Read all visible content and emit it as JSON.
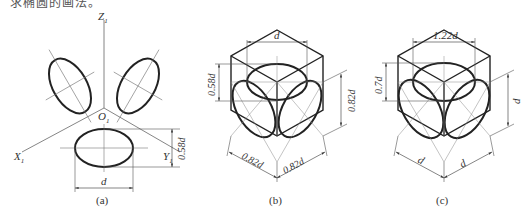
{
  "header_fragment": "求椭圆的画法。",
  "figures": [
    {
      "id": "a",
      "caption": "(a)",
      "axis_labels": {
        "z": "Z",
        "z_sub": "1",
        "x": "X",
        "x_sub": "1",
        "y": "Y",
        "y_sub": "1",
        "origin": "O",
        "origin_sub": "1"
      },
      "dimensions": {
        "width": "d",
        "height": "0.58d"
      }
    },
    {
      "id": "b",
      "caption": "(b)",
      "dimensions": {
        "top": "d",
        "left_vertical": "0.58d",
        "right_vertical": "0.82d",
        "bottom_left": "0.82d",
        "bottom_right": "0.82d"
      }
    },
    {
      "id": "c",
      "caption": "(c)",
      "dimensions": {
        "top": "1.22d",
        "left_vertical": "0.7d",
        "right_vertical": "d",
        "bottom_left": "d",
        "bottom_right": "d"
      }
    }
  ],
  "colors": {
    "stroke": "#222222",
    "thin": "#666666",
    "text": "#333333"
  }
}
